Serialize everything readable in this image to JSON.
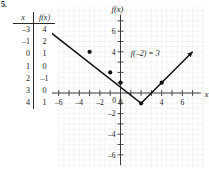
{
  "problem": {
    "number": "5."
  },
  "table": {
    "name": "table-of-values",
    "headers": [
      "x",
      "f(x)"
    ],
    "rows": [
      {
        "x": "–3",
        "fx": "4"
      },
      {
        "x": "–1",
        "fx": "2"
      },
      {
        "x": "0",
        "fx": "1"
      },
      {
        "x": "1",
        "fx": "0"
      },
      {
        "x": "2",
        "fx": "–1"
      },
      {
        "x": "3",
        "fx": "0"
      },
      {
        "x": "4",
        "fx": "1"
      }
    ]
  },
  "graph": {
    "x_axis_label": "x",
    "y_axis_label": "f(x)",
    "annotation": "f(–2) = 3",
    "x_tick_labels": [
      "–6",
      "–4",
      "–2",
      "0",
      "4",
      "6"
    ],
    "y_tick_labels": [
      "6",
      "4",
      "0",
      "–2",
      "–4",
      "–6"
    ]
  },
  "chart_data": {
    "type": "line",
    "title": "",
    "xlabel": "x",
    "ylabel": "f(x)",
    "xlim": [
      -8,
      8
    ],
    "ylim": [
      -7,
      8
    ],
    "grid": true,
    "legend": null,
    "annotations": [
      {
        "text": "f(–2) = 3",
        "x": 1.0,
        "y": 3.6
      }
    ],
    "x_ticks": [
      -6,
      -4,
      -2,
      0,
      2,
      4,
      6
    ],
    "x_tick_labels": [
      "–6",
      "–4",
      "–2",
      "0",
      "",
      "4",
      "6"
    ],
    "y_ticks": [
      6,
      4,
      2,
      0,
      -2,
      -4,
      -6
    ],
    "y_tick_labels": [
      "6",
      "4",
      "",
      "0",
      "–2",
      "–4",
      "–6"
    ],
    "series": [
      {
        "name": "f(x) = |x - 2| - 1",
        "shape": "v-shaped piecewise linear",
        "vertex": [
          2,
          -1
        ],
        "arrow_start": true,
        "arrow_end": true,
        "x": [
          -7.2,
          2,
          7.0
        ],
        "values": [
          6.2,
          -1,
          4.0
        ]
      }
    ],
    "marked_points": [
      {
        "x": -3,
        "y": 4
      },
      {
        "x": -1,
        "y": 2
      },
      {
        "x": 0,
        "y": 1
      },
      {
        "x": 2,
        "y": -1
      },
      {
        "x": 4,
        "y": 1
      }
    ]
  }
}
